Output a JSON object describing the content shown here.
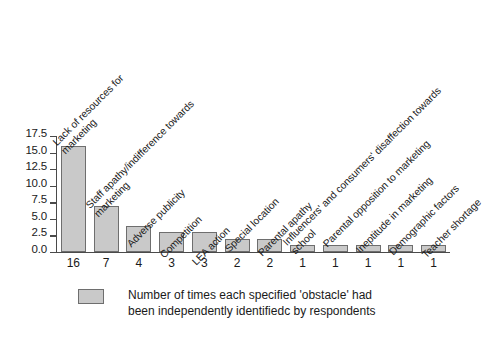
{
  "chart_data": {
    "type": "bar",
    "title": "",
    "subtitle": "",
    "xlabel": "",
    "ylabel": "",
    "ylim": [
      0.0,
      17.5
    ],
    "grid": false,
    "legend_position": "bottom-left",
    "categories": [
      "Lack of resources for\nmarketing",
      "Staff apathy/indifference towards\nmarketing",
      "Adverse publicity",
      "Competition",
      "LEA action",
      "Special location",
      "Parental apathy",
      "Influencers' and consumers' disaffection towards\nschool",
      "Parental opposition to marketing",
      "Ineptitude in marketing",
      "Demographic factors",
      "Teacher shortage"
    ],
    "values": [
      16,
      7,
      4,
      3,
      3,
      2,
      2,
      1,
      1,
      1,
      1,
      1
    ],
    "value_labels": [
      "16",
      "7",
      "4",
      "3",
      "3",
      "2",
      "2",
      "1",
      "1",
      "1",
      "1",
      "1"
    ],
    "yticks": [
      "0.0",
      "2.5",
      "5.0",
      "7.5",
      "10.0",
      "12.5",
      "15.0",
      "17.5"
    ],
    "ytick_values": [
      0.0,
      2.5,
      5.0,
      7.5,
      10.0,
      12.5,
      15.0,
      17.5
    ],
    "series": [
      {
        "name": "Number of times each specified 'obstacle' had been independently identifiedc by respondents",
        "values": [
          16,
          7,
          4,
          3,
          3,
          2,
          2,
          1,
          1,
          1,
          1,
          1
        ]
      }
    ],
    "colors": {
      "bar_fill": "#c9c9c9",
      "bar_stroke": "#6e6e6e",
      "axis": "#4a4a4a",
      "text": "#1a1a1a",
      "background": "#ffffff"
    }
  },
  "legend": {
    "line1": "Number of times each specified 'obstacle' had",
    "line2": "been independently identifiedc by respondents",
    "text": "Number of times each specified 'obstacle' had\nbeen independently identifiedc by respondents"
  }
}
